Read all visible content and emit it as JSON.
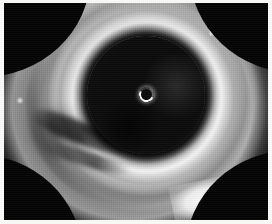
{
  "image": {
    "modality_label": "grayscale cross-sectional intravascular scan",
    "orientation": "axial",
    "color_mode": "grayscale",
    "frame_background": "#040404",
    "page_background": "#f7f7f5",
    "highlight_color": "#ffffff",
    "lumen_color": "#0a0a0a",
    "tissue_color": "#e8e8e8"
  },
  "frame": {
    "x": 4,
    "y": 3,
    "width": 264,
    "height": 217
  },
  "features": {
    "lumen": {
      "label": "dark central lumen",
      "center_x": 146,
      "center_y": 95,
      "radius": 59
    },
    "catheter_marker": {
      "label": "bright crescent catheter marker",
      "center_x": 146,
      "center_y": 94,
      "diameter": 15
    },
    "ring_outer": {
      "label": "outer bright tissue ring"
    },
    "ring_inner": {
      "label": "inner bright tissue ring"
    },
    "notch": {
      "label": "rectangular bright marker notch",
      "x": 213,
      "y": 11,
      "width": 17,
      "height": 13
    },
    "flare": {
      "label": "bright saturated flare region",
      "x": 168,
      "y": 176
    },
    "streak": {
      "label": "dark dissection shadow streak",
      "x": 22,
      "y": 118
    },
    "speck": {
      "label": "bright speck at left margin",
      "x": 12,
      "y": 94
    }
  }
}
